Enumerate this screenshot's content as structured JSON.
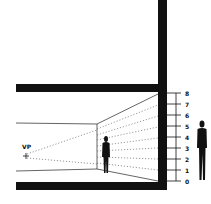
{
  "diagram": {
    "title": "",
    "vp_label": "VP",
    "scale_labels": [
      "0",
      "1",
      "2",
      "3",
      "4",
      "5",
      "6",
      "7",
      "8"
    ],
    "colors": {
      "ink": "#111111",
      "background": "#ffffff"
    }
  }
}
